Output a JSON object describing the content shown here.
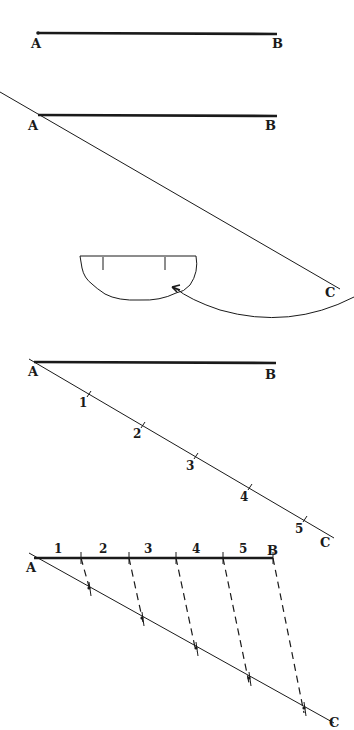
{
  "figure": {
    "type": "geometric-construction",
    "stroke_color": "#1a1a1a",
    "background": "#ffffff"
  },
  "steps": [
    {
      "labels": {
        "a": "A",
        "b": "B"
      }
    },
    {
      "labels": {
        "a": "A",
        "b": "B",
        "c": "C"
      }
    },
    {
      "labels": {
        "a": "A",
        "b": "B",
        "c": "C"
      },
      "divisions": [
        "1",
        "2",
        "3",
        "4",
        "5"
      ]
    },
    {
      "labels": {
        "a": "A",
        "b": "B",
        "c": "C"
      },
      "segments": [
        "1",
        "2",
        "3",
        "4",
        "5"
      ]
    }
  ]
}
